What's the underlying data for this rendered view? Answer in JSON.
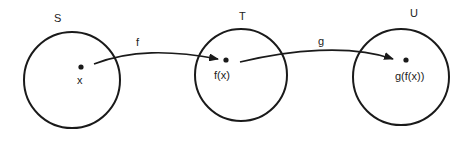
{
  "diagram": {
    "type": "function-composition",
    "sets": [
      {
        "id": "S",
        "label": "S",
        "element_label": "x"
      },
      {
        "id": "T",
        "label": "T",
        "element_label": "f(x)"
      },
      {
        "id": "U",
        "label": "U",
        "element_label": "g(f(x))"
      }
    ],
    "mappings": [
      {
        "id": "f",
        "label": "f",
        "from": "S",
        "to": "T"
      },
      {
        "id": "g",
        "label": "g",
        "from": "T",
        "to": "U"
      }
    ]
  }
}
